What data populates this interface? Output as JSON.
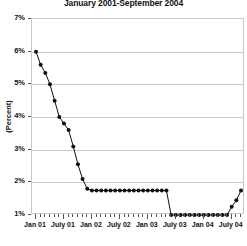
{
  "chart_data": {
    "type": "line",
    "title": "January 2001-September 2004",
    "xlabel": "",
    "ylabel": "(Percent)",
    "ylim": [
      1,
      7
    ],
    "yticks": [
      1,
      2,
      3,
      4,
      5,
      6,
      7
    ],
    "ytick_labels": [
      "1%",
      "2%",
      "3%",
      "4%",
      "5%",
      "6%",
      "7%"
    ],
    "grid": true,
    "legend": "none",
    "xtick_labels": [
      "Jan 01",
      "July 01",
      "Jan 02",
      "July 02",
      "Jan 03",
      "July 03",
      "Jan 04",
      "July 04"
    ],
    "xtick_indices": [
      0,
      6,
      12,
      18,
      24,
      30,
      36,
      42
    ],
    "x": [
      "Jan 01",
      "Feb 01",
      "Mar 01",
      "Apr 01",
      "May 01",
      "Jun 01",
      "Jul 01",
      "Aug 01",
      "Sep 01",
      "Oct 01",
      "Nov 01",
      "Dec 01",
      "Jan 02",
      "Feb 02",
      "Mar 02",
      "Apr 02",
      "May 02",
      "Jun 02",
      "Jul 02",
      "Aug 02",
      "Sep 02",
      "Oct 02",
      "Nov 02",
      "Dec 02",
      "Jan 03",
      "Feb 03",
      "Mar 03",
      "Apr 03",
      "May 03",
      "Jun 03",
      "Jul 03",
      "Aug 03",
      "Sep 03",
      "Oct 03",
      "Nov 03",
      "Dec 03",
      "Jan 04",
      "Feb 04",
      "Mar 04",
      "Apr 04",
      "May 04",
      "Jun 04",
      "Jul 04",
      "Aug 04",
      "Sep 04"
    ],
    "series": [
      {
        "name": "Federal funds rate",
        "values": [
          6.0,
          5.6,
          5.35,
          5.0,
          4.5,
          4.0,
          3.8,
          3.6,
          3.1,
          2.55,
          2.1,
          1.8,
          1.75,
          1.75,
          1.75,
          1.75,
          1.75,
          1.75,
          1.75,
          1.75,
          1.75,
          1.75,
          1.75,
          1.75,
          1.75,
          1.75,
          1.75,
          1.75,
          1.75,
          1.0,
          1.0,
          1.0,
          1.0,
          1.0,
          1.0,
          1.0,
          1.0,
          1.0,
          1.0,
          1.0,
          1.0,
          1.0,
          1.25,
          1.45,
          1.75
        ]
      }
    ],
    "axis_color": "#c9c9c9",
    "series_color": "#111111",
    "background_color": "#ffffff"
  }
}
